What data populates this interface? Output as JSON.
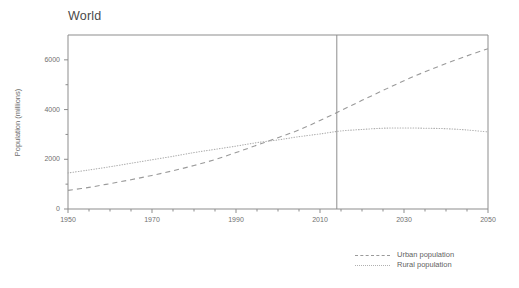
{
  "chart_data": {
    "type": "line",
    "title": "World",
    "xlabel": "",
    "ylabel": "Population (millions)",
    "xlim": [
      1950,
      2050
    ],
    "ylim": [
      0,
      7000
    ],
    "xticks": [
      1950,
      1970,
      1990,
      2010,
      2030,
      2050
    ],
    "xtick_labels": [
      "1950",
      "1970",
      "1990",
      "2010",
      "2030",
      "2050"
    ],
    "xminor_step": 5,
    "yticks": [
      0,
      2000,
      4000,
      6000
    ],
    "ytick_labels": [
      "0",
      "2000",
      "4000",
      "6000"
    ],
    "yminor_ticks": [
      1000,
      3000,
      5000
    ],
    "grid": false,
    "legend_position": "bottom-right",
    "annotations": [
      {
        "type": "vertical-line",
        "x": 2014,
        "label": ""
      }
    ],
    "x": [
      1950,
      1955,
      1960,
      1965,
      1970,
      1975,
      1980,
      1985,
      1990,
      1995,
      2000,
      2005,
      2010,
      2015,
      2020,
      2025,
      2030,
      2035,
      2040,
      2045,
      2050
    ],
    "series": [
      {
        "name": "Urban population",
        "style": "dashed",
        "color": "#9a9a9a",
        "values": [
          750,
          870,
          1020,
          1180,
          1350,
          1540,
          1750,
          1990,
          2270,
          2570,
          2870,
          3180,
          3560,
          3960,
          4370,
          4770,
          5160,
          5520,
          5850,
          6160,
          6450
        ]
      },
      {
        "name": "Rural population",
        "style": "dotted",
        "color": "#b0b0b0",
        "values": [
          1450,
          1570,
          1700,
          1840,
          1980,
          2120,
          2270,
          2400,
          2530,
          2670,
          2780,
          2910,
          3020,
          3140,
          3200,
          3250,
          3260,
          3250,
          3230,
          3180,
          3100
        ]
      }
    ]
  },
  "legend": {
    "items": [
      {
        "label": "Urban population"
      },
      {
        "label": "Rural population"
      }
    ]
  }
}
